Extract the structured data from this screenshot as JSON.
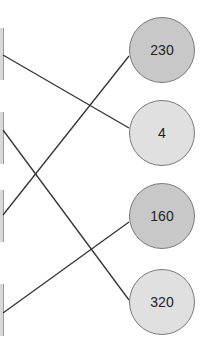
{
  "diagram": {
    "type": "matching",
    "right_nodes": [
      {
        "label": "230",
        "fill": "#c8c8c8",
        "cx": 162,
        "cy": 50
      },
      {
        "label": "4",
        "fill": "#e0e0e0",
        "cx": 162,
        "cy": 133
      },
      {
        "label": "160",
        "fill": "#c8c8c8",
        "cx": 162,
        "cy": 216
      },
      {
        "label": "320",
        "fill": "#e0e0e0",
        "cx": 162,
        "cy": 302
      }
    ],
    "connections": [
      {
        "from_left": 1,
        "to": "4"
      },
      {
        "from_left": 2,
        "to": "320"
      },
      {
        "from_left": 3,
        "to": "230"
      },
      {
        "from_left": 4,
        "to": "160"
      }
    ]
  }
}
